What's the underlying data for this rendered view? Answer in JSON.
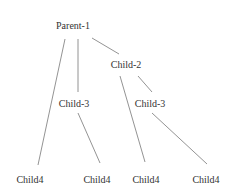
{
  "diagram": {
    "type": "tree",
    "nodes": [
      {
        "id": "n0",
        "label": "Parent-1",
        "x": 73,
        "y": 29
      },
      {
        "id": "n1",
        "label": "Child-2",
        "x": 126,
        "y": 68
      },
      {
        "id": "n2",
        "label": "Child-3",
        "x": 74,
        "y": 107
      },
      {
        "id": "n3",
        "label": "Child-3",
        "x": 150,
        "y": 107
      },
      {
        "id": "n4",
        "label": "Child4",
        "x": 30,
        "y": 183
      },
      {
        "id": "n5",
        "label": "Child4",
        "x": 97,
        "y": 183
      },
      {
        "id": "n6",
        "label": "Child4",
        "x": 146,
        "y": 183
      },
      {
        "id": "n7",
        "label": "Child4",
        "x": 206,
        "y": 183
      }
    ],
    "edges": [
      {
        "from": "n0",
        "to": "n4",
        "x1": 65,
        "y1": 39,
        "x2": 38,
        "y2": 165
      },
      {
        "from": "n0",
        "to": "n2",
        "x1": 78,
        "y1": 39,
        "x2": 78,
        "y2": 92
      },
      {
        "from": "n0",
        "to": "n1",
        "x1": 92,
        "y1": 38,
        "x2": 119,
        "y2": 54
      },
      {
        "from": "n1",
        "to": "n6",
        "x1": 120,
        "y1": 76,
        "x2": 145,
        "y2": 162
      },
      {
        "from": "n1",
        "to": "n3",
        "x1": 138,
        "y1": 76,
        "x2": 152,
        "y2": 92
      },
      {
        "from": "n2",
        "to": "n5",
        "x1": 78,
        "y1": 113,
        "x2": 100,
        "y2": 163
      },
      {
        "from": "n3",
        "to": "n7",
        "x1": 152,
        "y1": 113,
        "x2": 207,
        "y2": 164
      }
    ]
  }
}
